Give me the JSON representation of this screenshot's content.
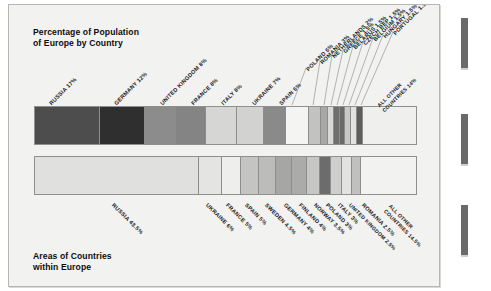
{
  "figure": {
    "top_chart_title": "Percentage of Population\nof Europe by Country",
    "bottom_chart_title": "Areas of Countries\nwithin Europe"
  },
  "chart_data": [
    {
      "type": "bar",
      "orientation": "horizontal-stacked",
      "title": "Percentage of Population of Europe by Country",
      "xlabel": "",
      "ylabel": "",
      "unit": "percent",
      "total": 100,
      "categories": [
        "RUSSIA",
        "GERMANY",
        "UNITED KINGDOM",
        "FRANCE",
        "ITALY",
        "UKRAINE",
        "SPAIN",
        "POLAND",
        "ROMANIA",
        "NETHERLANDS",
        "GREECE",
        "BELARUS",
        "CZECH REP",
        "BELGIUM",
        "HUNGARY",
        "PORTUGAL",
        "ALL OTHER COUNTRIES"
      ],
      "values": [
        17,
        12,
        8,
        8,
        8,
        7,
        6,
        6,
        3,
        2,
        1.5,
        1.5,
        1.5,
        1.5,
        1.5,
        1.5,
        14
      ],
      "labels": [
        "RUSSIA 17%",
        "GERMANY 12%",
        "UNITED KINGDOM 8%",
        "FRANCE 8%",
        "ITALY 8%",
        "UKRAINE 7%",
        "SPAIN 6%",
        "POLAND 6%",
        "ROMANIA 3%",
        "NETHERLANDS 2%",
        "GREECE 1.5%",
        "BELARUS 1.5%",
        "CZECH REP 1.5%",
        "BELGIUM 1.5%",
        "HUNGARY 1.5%",
        "PORTUGAL 1.5%",
        "ALL OTHER COUNTRIES 14%"
      ],
      "colors": [
        "#4d4d4d",
        "#2f2f2f",
        "#8c8c8c",
        "#848484",
        "#d6d6d4",
        "#d2d2d0",
        "#8a8a8a",
        "#f4f4f2",
        "#c2c2c0",
        "#a8a8a6",
        "#d8d8d6",
        "#6e6e6e",
        "#6a6a6a",
        "#c8c8c6",
        "#e2e2e0",
        "#5e5e5e",
        "#efefed"
      ]
    },
    {
      "type": "bar",
      "orientation": "horizontal-stacked",
      "title": "Areas of Countries within Europe",
      "xlabel": "",
      "ylabel": "",
      "unit": "percent",
      "total": 100,
      "categories": [
        "RUSSIA",
        "UKRAINE",
        "FRANCE",
        "SPAIN",
        "SWEDEN",
        "GERMANY",
        "FINLAND",
        "NORWAY",
        "POLAND",
        "ITALY",
        "UNITED KINGDOM",
        "ROMANIA",
        "ALL OTHER COUNTRIES"
      ],
      "values": [
        43.5,
        6,
        5,
        5,
        4.5,
        4,
        4,
        3.5,
        3,
        3,
        2.5,
        2.5,
        14.5
      ],
      "labels": [
        "RUSSIA 43.5%",
        "UKRAINE 6%",
        "FRANCE 5%",
        "SPAIN 5%",
        "SWEDEN 4.5%",
        "GERMANY 4%",
        "FINLAND 4%",
        "NORWAY 3.5%",
        "POLAND 3%",
        "ITALY 3%",
        "UNITED KINGDOM 2.5%",
        "ROMANIA 2.5%",
        "ALL OTHER COUNTRIES 14.5%"
      ],
      "colors": [
        "#e0e0de",
        "#e4e4e2",
        "#eeeeec",
        "#c4c4c2",
        "#bcbcba",
        "#a6a6a4",
        "#ababa9",
        "#c6c6c4",
        "#6c6c6c",
        "#cececc",
        "#e2e2e0",
        "#c0c0be",
        "#f2f2f0"
      ]
    }
  ]
}
